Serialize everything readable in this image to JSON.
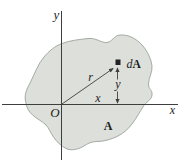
{
  "figure": {
    "type": "area-moment-of-inertia-diagram",
    "labels": {
      "y_axis": "y",
      "x_axis": "x",
      "origin": "O",
      "radius": "r",
      "x_coordinate": "x",
      "y_coordinate": "y",
      "element_differential": "d",
      "element_area": "A",
      "area": "A"
    },
    "colors": {
      "background": "#ffffff",
      "area_fill": "#dcdfda",
      "area_outline": "#9aa39b",
      "line": "#3e3e3e",
      "text": "#1c1c1c",
      "element_square": "#222222"
    }
  }
}
